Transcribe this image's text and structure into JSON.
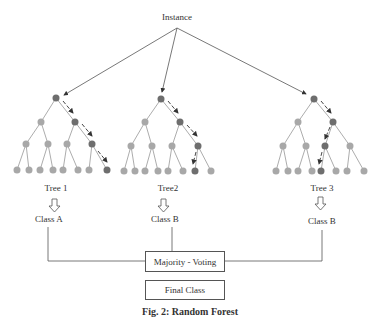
{
  "title": "Instance",
  "trees": [
    {
      "label": "Tree 1",
      "class": "Class A"
    },
    {
      "label": "Tree2",
      "class": "Class B"
    },
    {
      "label": "Tree 3",
      "class": "Class B"
    }
  ],
  "voting_label": "Majority - Voting",
  "final_label": "Final Class",
  "caption": "Fig. 2: Random Forest",
  "colors": {
    "dark_node": "#6e6e6e",
    "light_node": "#a8a8a8",
    "line": "#666666"
  }
}
